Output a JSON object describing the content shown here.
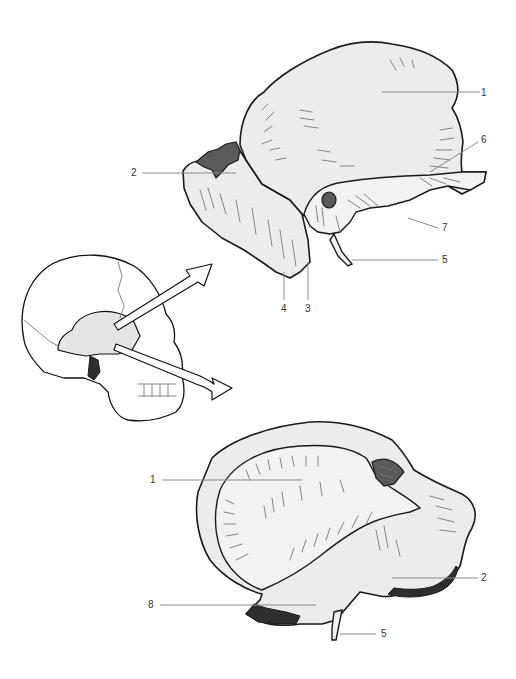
{
  "figure": {
    "views": [
      {
        "id": "lateral-view",
        "labels": [
          {
            "number": "1",
            "x": 484,
            "y": 89
          },
          {
            "number": "2",
            "x": 131,
            "y": 168
          },
          {
            "number": "6",
            "x": 482,
            "y": 135
          },
          {
            "number": "7",
            "x": 442,
            "y": 225
          },
          {
            "number": "5",
            "x": 442,
            "y": 256
          },
          {
            "number": "4",
            "x": 281,
            "y": 306
          },
          {
            "number": "3",
            "x": 305,
            "y": 306
          }
        ]
      },
      {
        "id": "medial-view",
        "labels": [
          {
            "number": "1",
            "x": 150,
            "y": 475
          },
          {
            "number": "2",
            "x": 482,
            "y": 573
          },
          {
            "number": "8",
            "x": 148,
            "y": 601
          },
          {
            "number": "5",
            "x": 382,
            "y": 630
          }
        ]
      },
      {
        "id": "skull-orientation",
        "labels": []
      }
    ]
  }
}
